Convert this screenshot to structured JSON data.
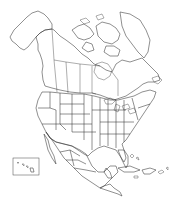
{
  "map": {
    "title": "North America outline map",
    "style": "blank political outline, black on white",
    "stroke_color": "#333333",
    "background_color": "#ffffff",
    "regions": [
      "Alaska",
      "Canada",
      "Greenland (partial)",
      "United States (states outlined)",
      "Mexico (states outlined)",
      "Central America",
      "Caribbean islands"
    ],
    "insets": [
      {
        "name": "Hawaii inset box"
      }
    ]
  }
}
